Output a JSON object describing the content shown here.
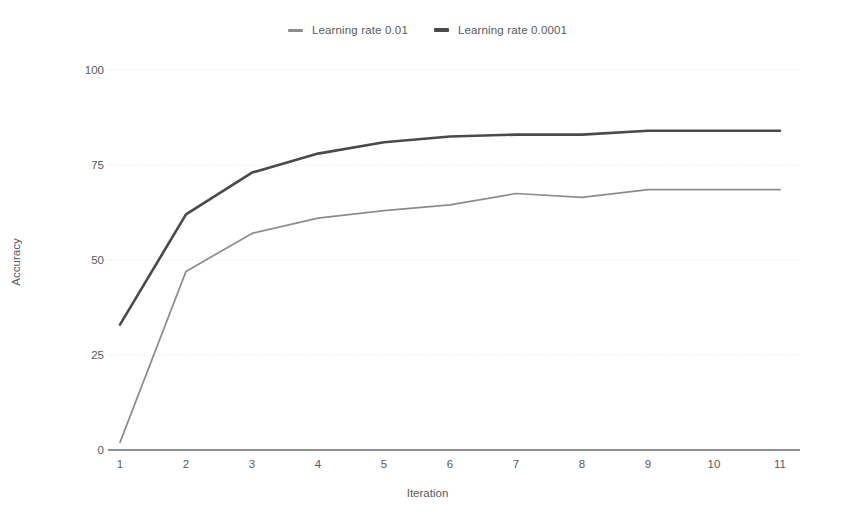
{
  "chart_data": {
    "type": "line",
    "title": "",
    "xlabel": "Iteration",
    "ylabel": "Accuracy",
    "x": [
      1,
      2,
      3,
      4,
      5,
      6,
      7,
      8,
      9,
      10,
      11
    ],
    "xticklabels": [
      "1",
      "2",
      "3",
      "4",
      "5",
      "6",
      "7",
      "8",
      "9",
      "10",
      "11"
    ],
    "yticks": [
      0,
      25,
      50,
      75,
      100
    ],
    "yticklabels": [
      "0",
      "25",
      "50",
      "75",
      "100"
    ],
    "ylim": [
      0,
      100
    ],
    "xlim": [
      1,
      11
    ],
    "grid": "horizontal-dotted",
    "legend_position": "top-center",
    "series": [
      {
        "name": "Learning rate 0.01",
        "color": "#8c8c8e",
        "values": [
          2,
          47,
          57,
          61,
          63,
          64.5,
          67.5,
          66.5,
          68.5,
          68.5,
          68.5
        ]
      },
      {
        "name": "Learning rate 0.0001",
        "color": "#4a4a4c",
        "values": [
          33,
          62,
          73,
          78,
          81,
          82.5,
          83,
          83,
          84,
          84,
          84
        ]
      }
    ]
  },
  "legend": {
    "items": [
      {
        "label": "Learning rate 0.01",
        "color": "#8c8c8e"
      },
      {
        "label": "Learning rate 0.0001",
        "color": "#4a4a4c"
      }
    ]
  },
  "axes": {
    "x_title": "Iteration",
    "y_title": "Accuracy"
  },
  "colors": {
    "background": "#ffffff",
    "axis_line": "#6e6e70",
    "gridline": "#e3e3e6",
    "text": "#59595b"
  }
}
